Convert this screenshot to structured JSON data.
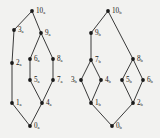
{
  "figure": {
    "background_color": "#f2f2f0",
    "node_color": "#1a1a1a",
    "edge_color": "#3a3a3a"
  },
  "diagrams": [
    {
      "id": "poset-a",
      "suffix": "a",
      "nodes": [
        {
          "id": "0a",
          "label": "0",
          "sub": "a",
          "x": 30,
          "y": 126,
          "label_dx": 4,
          "label_dy": 0
        },
        {
          "id": "1a",
          "label": "1",
          "sub": "a",
          "x": 12,
          "y": 103,
          "label_dx": 4,
          "label_dy": 0
        },
        {
          "id": "2a",
          "label": "2",
          "sub": "a",
          "x": 12,
          "y": 63,
          "label_dx": 4,
          "label_dy": 0
        },
        {
          "id": "3a",
          "label": "3",
          "sub": "a",
          "x": 14,
          "y": 30,
          "label_dx": 4,
          "label_dy": 0
        },
        {
          "id": "4a",
          "label": "4",
          "sub": "a",
          "x": 42,
          "y": 103,
          "label_dx": 4,
          "label_dy": 0
        },
        {
          "id": "5a",
          "label": "5",
          "sub": "a",
          "x": 30,
          "y": 80,
          "label_dx": 4,
          "label_dy": 0
        },
        {
          "id": "6a",
          "label": "6",
          "sub": "a",
          "x": 30,
          "y": 59,
          "label_dx": 4,
          "label_dy": 0
        },
        {
          "id": "7a",
          "label": "7",
          "sub": "a",
          "x": 53,
          "y": 80,
          "label_dx": 4,
          "label_dy": 0
        },
        {
          "id": "8a",
          "label": "8",
          "sub": "a",
          "x": 53,
          "y": 59,
          "label_dx": 4,
          "label_dy": 0
        },
        {
          "id": "9a",
          "label": "9",
          "sub": "a",
          "x": 41,
          "y": 33,
          "label_dx": 4,
          "label_dy": 0
        },
        {
          "id": "10a",
          "label": "10",
          "sub": "a",
          "x": 32,
          "y": 11,
          "label_dx": 4,
          "label_dy": 0
        }
      ],
      "edges": [
        [
          "0a",
          "1a"
        ],
        [
          "0a",
          "4a"
        ],
        [
          "1a",
          "2a"
        ],
        [
          "2a",
          "3a"
        ],
        [
          "3a",
          "10a"
        ],
        [
          "4a",
          "5a"
        ],
        [
          "4a",
          "7a"
        ],
        [
          "5a",
          "6a"
        ],
        [
          "7a",
          "8a"
        ],
        [
          "6a",
          "9a"
        ],
        [
          "8a",
          "9a"
        ],
        [
          "9a",
          "10a"
        ]
      ]
    },
    {
      "id": "poset-b",
      "suffix": "b",
      "nodes": [
        {
          "id": "0b",
          "label": "0",
          "sub": "b",
          "x": 112,
          "y": 126,
          "label_dx": 4,
          "label_dy": 0
        },
        {
          "id": "1b",
          "label": "1",
          "sub": "b",
          "x": 91,
          "y": 103,
          "label_dx": 4,
          "label_dy": 0
        },
        {
          "id": "2b",
          "label": "2",
          "sub": "b",
          "x": 133,
          "y": 103,
          "label_dx": 4,
          "label_dy": 0
        },
        {
          "id": "3b",
          "label": "3",
          "sub": "b",
          "x": 81,
          "y": 80,
          "label_dx": -10,
          "label_dy": 0
        },
        {
          "id": "4b",
          "label": "4",
          "sub": "b",
          "x": 101,
          "y": 80,
          "label_dx": 4,
          "label_dy": 0
        },
        {
          "id": "5b",
          "label": "5",
          "sub": "b",
          "x": 122,
          "y": 80,
          "label_dx": 4,
          "label_dy": 0
        },
        {
          "id": "6b",
          "label": "6",
          "sub": "b",
          "x": 143,
          "y": 80,
          "label_dx": 4,
          "label_dy": 0
        },
        {
          "id": "7b",
          "label": "7",
          "sub": "b",
          "x": 91,
          "y": 60,
          "label_dx": 4,
          "label_dy": 0
        },
        {
          "id": "8b",
          "label": "8",
          "sub": "b",
          "x": 133,
          "y": 59,
          "label_dx": 4,
          "label_dy": 0
        },
        {
          "id": "9b",
          "label": "9",
          "sub": "b",
          "x": 91,
          "y": 33,
          "label_dx": 4,
          "label_dy": 0
        },
        {
          "id": "10b",
          "label": "10",
          "sub": "b",
          "x": 108,
          "y": 11,
          "label_dx": 4,
          "label_dy": 0
        }
      ],
      "edges": [
        [
          "0b",
          "1b"
        ],
        [
          "0b",
          "2b"
        ],
        [
          "1b",
          "3b"
        ],
        [
          "1b",
          "4b"
        ],
        [
          "2b",
          "5b"
        ],
        [
          "2b",
          "6b"
        ],
        [
          "3b",
          "7b"
        ],
        [
          "4b",
          "7b"
        ],
        [
          "5b",
          "8b"
        ],
        [
          "6b",
          "8b"
        ],
        [
          "7b",
          "9b"
        ],
        [
          "9b",
          "10b"
        ],
        [
          "8b",
          "10b"
        ]
      ]
    }
  ]
}
